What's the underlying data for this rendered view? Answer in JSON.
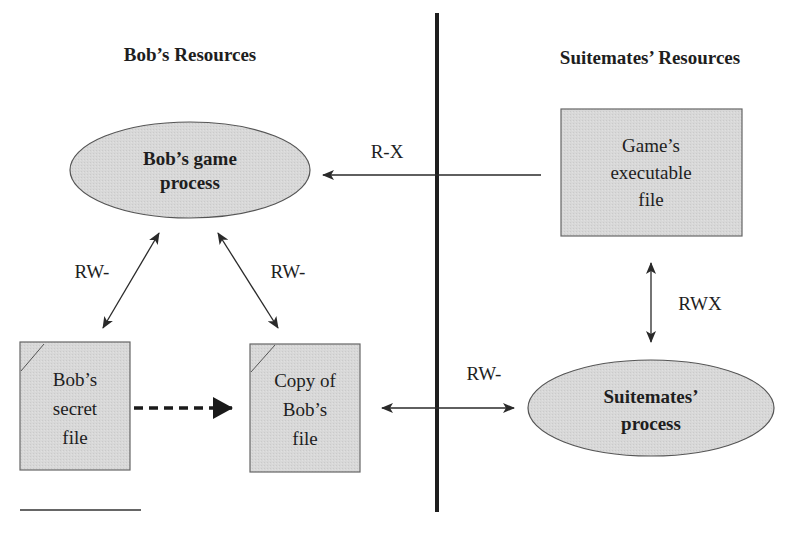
{
  "headings": {
    "left": "Bob’s Resources",
    "right": "Suitemates’ Resources"
  },
  "nodes": {
    "bob_process": {
      "type": "process-ellipse",
      "line1": "Bob’s game",
      "line2": "process"
    },
    "game_exe": {
      "type": "file-box",
      "line1": "Game’s",
      "line2": "executable",
      "line3": "file"
    },
    "secret_file": {
      "type": "file-doc",
      "line1": "Bob’s",
      "line2": "secret",
      "line3": "file"
    },
    "copy_file": {
      "type": "file-doc",
      "line1": "Copy of",
      "line2": "Bob’s",
      "line3": "file"
    },
    "suite_process": {
      "type": "process-ellipse",
      "line1": "Suitemates’",
      "line2": "process"
    }
  },
  "edges": {
    "exe_to_bob": {
      "label": "R-X",
      "from": "game_exe",
      "to": "bob_process",
      "style": "solid",
      "direction": "one-way"
    },
    "bob_secret": {
      "label": "RW-",
      "from": "bob_process",
      "to": "secret_file",
      "style": "solid",
      "direction": "two-way"
    },
    "bob_copy": {
      "label": "RW-",
      "from": "bob_process",
      "to": "copy_file",
      "style": "solid",
      "direction": "two-way"
    },
    "secret_to_copy": {
      "label": "",
      "from": "secret_file",
      "to": "copy_file",
      "style": "dashed",
      "direction": "one-way"
    },
    "copy_suite": {
      "label": "RW-",
      "from": "copy_file",
      "to": "suite_process",
      "style": "solid",
      "direction": "two-way"
    },
    "exe_suite": {
      "label": "RWX",
      "from": "game_exe",
      "to": "suite_process",
      "style": "solid",
      "direction": "two-way"
    }
  },
  "colors": {
    "fill": "#d6d6d6",
    "stroke": "#555555",
    "line": "#2a2a2a",
    "divider": "#1e1e1e"
  }
}
